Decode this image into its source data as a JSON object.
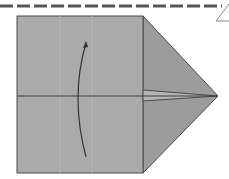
{
  "diagram": {
    "type": "origami-fold-step",
    "colors": {
      "paper": "#a9a9a9",
      "paper_shade": "#9a9a9a",
      "edge": "#4a4a4a",
      "dash": "#555555",
      "arrow": "#333333",
      "background": "#ffffff"
    },
    "elements": [
      "valley-fold-dashed-line",
      "square-base",
      "triangle-flap",
      "center-crease",
      "fold-arrow"
    ]
  }
}
